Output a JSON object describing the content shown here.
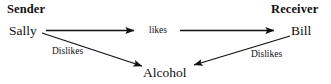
{
  "diagram": {
    "type": "directed-graph",
    "title": "",
    "background_color": "#ffffff",
    "line_color": "#111111",
    "text_color": "#111111",
    "headings": {
      "sender": "Sender",
      "receiver": "Receiver"
    },
    "nodes": [
      {
        "id": "sally",
        "label": "Sally",
        "role": "sender"
      },
      {
        "id": "bill",
        "label": "Bill",
        "role": "receiver"
      },
      {
        "id": "alcohol",
        "label": "Alcohol",
        "role": "object"
      }
    ],
    "edges": [
      {
        "id": "sally-likes-bill",
        "from": "sally",
        "to": "bill",
        "label": "likes",
        "style": "split-horizontal"
      },
      {
        "id": "sally-dislikes-alcohol",
        "from": "sally",
        "to": "alcohol",
        "label": "Dislikes",
        "style": "diagonal"
      },
      {
        "id": "bill-dislikes-alcohol",
        "from": "bill",
        "to": "alcohol",
        "label": "Dislikes",
        "style": "diagonal"
      }
    ]
  }
}
